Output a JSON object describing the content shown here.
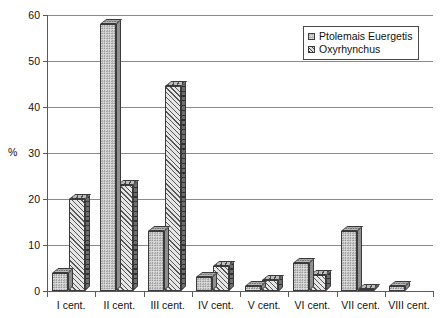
{
  "chart_data": {
    "type": "bar",
    "title": "",
    "xlabel": "",
    "ylabel": "%",
    "ylim": [
      0,
      60
    ],
    "yticks": [
      0,
      10,
      20,
      30,
      40,
      50,
      60
    ],
    "ytick_labels": [
      "0",
      "10",
      "20",
      "30",
      "40",
      "50",
      "60"
    ],
    "grid": true,
    "legend_position": "top-right",
    "categories": [
      "I cent.",
      "II cent.",
      "III cent.",
      "IV cent.",
      "V cent.",
      "VI cent.",
      "VII cent.",
      "VIII cent."
    ],
    "series": [
      {
        "name": "Ptolemais Euergetis",
        "fill": "dotted",
        "color": "#dcdcdc",
        "values": [
          4,
          58,
          13,
          3,
          1,
          6,
          13,
          1
        ]
      },
      {
        "name": "Oxyrhynchus",
        "fill": "diagonal-hatch",
        "color": "#e6e6e6",
        "values": [
          20,
          23,
          44.5,
          5.5,
          2.5,
          3.5,
          0.5,
          0
        ]
      }
    ]
  },
  "colors": {
    "axis": "#5a5a5a",
    "gridline": "#8a8a8a",
    "bar_outline": "#3a3a3a",
    "background": "#ffffff",
    "text": "#111111"
  }
}
